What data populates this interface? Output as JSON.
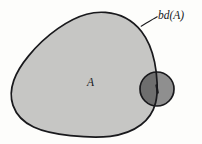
{
  "figure": {
    "type": "topology-set-boundary-diagram",
    "background_color": "#fdfdfb",
    "labels": {
      "boundary_label": "bd(A)",
      "set_label": "A"
    },
    "colors": {
      "set_fill": "#c6c6c4",
      "neighborhood_fill": "#8f8f8f",
      "overlap_fill": "#6e6e6e",
      "outline": "#19191c",
      "label_text": "#16161a"
    },
    "shapes": {
      "set_blob": {
        "name": "A",
        "description": "closed irregular blob region filled light gray with dark outline",
        "fill": "#c6c6c4",
        "stroke": "#19191c",
        "stroke_width": 1.7,
        "approx_bounds": {
          "x": 11,
          "y": 12,
          "width": 146,
          "height": 125
        }
      },
      "neighborhood_circle": {
        "name": "epsilon-neighborhood",
        "description": "small circle straddling the boundary of A",
        "center": {
          "x": 157,
          "y": 89
        },
        "radius": 17,
        "fill": "#8f8f8f",
        "stroke": "#19191c",
        "stroke_width": 1.7
      },
      "boundary_point": {
        "name": "boundary-point",
        "description": "tick marking a point on bd(A) at the circle center",
        "x": 157,
        "y": 89
      },
      "leader_line": {
        "name": "leader-line-to-boundary",
        "from": {
          "x": 157,
          "y": 17
        },
        "to": {
          "x": 141,
          "y": 26
        },
        "stroke": "#19191c",
        "stroke_width": 1.1
      }
    }
  }
}
